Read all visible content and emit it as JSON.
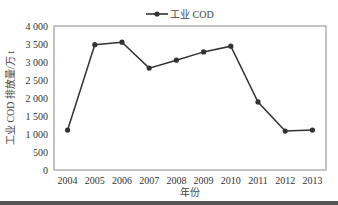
{
  "chart_data": {
    "type": "line",
    "title": "",
    "xlabel": "年份",
    "ylabel": "工业 COD 排放量/万 t",
    "categories": [
      "2004",
      "2005",
      "2006",
      "2007",
      "2008",
      "2009",
      "2010",
      "2011",
      "2012",
      "2013"
    ],
    "series": [
      {
        "name": "工业 COD",
        "values": [
          1110,
          3480,
          3550,
          2830,
          3050,
          3280,
          3440,
          1890,
          1080,
          1110
        ],
        "color": "#333333",
        "marker": "circle"
      }
    ],
    "ylim": [
      0,
      4000
    ],
    "yticks": [
      0,
      500,
      1000,
      1500,
      2000,
      2500,
      3000,
      3500,
      4000
    ],
    "ytick_labels": [
      "0",
      "500",
      "1 000",
      "1 500",
      "2 000",
      "2 500",
      "3 000",
      "3 500",
      "4 000"
    ],
    "grid": false,
    "legend_position": "top-center"
  },
  "colors": {
    "line": "#333333",
    "frame": "#888888",
    "text": "#333333",
    "band": "#555555"
  }
}
